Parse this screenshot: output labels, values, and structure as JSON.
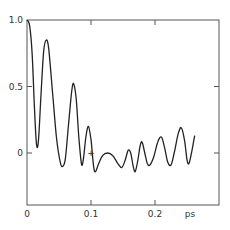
{
  "chart_data": {
    "type": "line",
    "title": "",
    "xlabel": "ps",
    "ylabel": "",
    "xlim": [
      0,
      0.3
    ],
    "ylim": [
      -0.4,
      1.0
    ],
    "grid": false,
    "legend": null,
    "x_ticks": [
      {
        "value": 0,
        "label": "0"
      },
      {
        "value": 0.1,
        "label": "0.1"
      },
      {
        "value": 0.2,
        "label": "0.2"
      }
    ],
    "y_ticks": [
      {
        "value": 0,
        "label": "0"
      },
      {
        "value": 0.5,
        "label": "0.5"
      },
      {
        "value": 1.0,
        "label": "1.0"
      }
    ],
    "annotations": [
      {
        "text": "+",
        "x": 0.1,
        "y": 0.0
      }
    ],
    "series": [
      {
        "name": "curve",
        "color": "#222222",
        "points": [
          [
            0.0,
            1.0
          ],
          [
            0.004,
            0.96
          ],
          [
            0.008,
            0.75
          ],
          [
            0.012,
            0.3
          ],
          [
            0.015,
            0.06
          ],
          [
            0.018,
            0.1
          ],
          [
            0.022,
            0.45
          ],
          [
            0.026,
            0.76
          ],
          [
            0.03,
            0.85
          ],
          [
            0.034,
            0.78
          ],
          [
            0.04,
            0.45
          ],
          [
            0.046,
            0.12
          ],
          [
            0.052,
            -0.07
          ],
          [
            0.056,
            -0.1
          ],
          [
            0.06,
            -0.04
          ],
          [
            0.065,
            0.22
          ],
          [
            0.07,
            0.47
          ],
          [
            0.073,
            0.52
          ],
          [
            0.077,
            0.4
          ],
          [
            0.081,
            0.12
          ],
          [
            0.085,
            -0.08
          ],
          [
            0.088,
            -0.05
          ],
          [
            0.092,
            0.12
          ],
          [
            0.096,
            0.2
          ],
          [
            0.1,
            0.1
          ],
          [
            0.104,
            -0.1
          ],
          [
            0.107,
            -0.14
          ],
          [
            0.112,
            -0.08
          ],
          [
            0.118,
            -0.02
          ],
          [
            0.126,
            0.0
          ],
          [
            0.134,
            -0.02
          ],
          [
            0.142,
            -0.08
          ],
          [
            0.148,
            -0.11
          ],
          [
            0.153,
            -0.06
          ],
          [
            0.158,
            0.02
          ],
          [
            0.162,
            0.0
          ],
          [
            0.166,
            -0.1
          ],
          [
            0.169,
            -0.14
          ],
          [
            0.173,
            -0.06
          ],
          [
            0.177,
            0.06
          ],
          [
            0.18,
            0.08
          ],
          [
            0.184,
            0.0
          ],
          [
            0.188,
            -0.08
          ],
          [
            0.192,
            -0.09
          ],
          [
            0.198,
            -0.03
          ],
          [
            0.204,
            0.08
          ],
          [
            0.21,
            0.12
          ],
          [
            0.215,
            0.04
          ],
          [
            0.22,
            -0.07
          ],
          [
            0.225,
            -0.09
          ],
          [
            0.23,
            0.0
          ],
          [
            0.236,
            0.14
          ],
          [
            0.241,
            0.19
          ],
          [
            0.246,
            0.1
          ],
          [
            0.25,
            -0.05
          ],
          [
            0.253,
            -0.08
          ],
          [
            0.257,
            0.0
          ],
          [
            0.262,
            0.13
          ]
        ]
      }
    ]
  }
}
